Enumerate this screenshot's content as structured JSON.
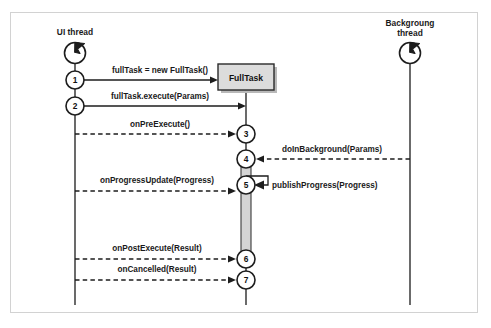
{
  "diagram": {
    "type": "uml-sequence-diagram",
    "frame": {
      "border_color": "#d2d2d2",
      "background": "#ffffff"
    },
    "lifelines": [
      {
        "id": "ui",
        "label_line1": "UI thread",
        "label_line2": "",
        "icon": "thread-icon",
        "x": 75
      },
      {
        "id": "bg",
        "label_line1": "Backgroung",
        "label_line2": "thread",
        "icon": "thread-icon",
        "x": 410
      }
    ],
    "object_box": {
      "label": "FullTask",
      "fill": "#dcdcdc",
      "border": "#2a2a2a",
      "x": 218,
      "y": 64,
      "width": 56,
      "height": 26
    },
    "activation": {
      "fill": "#d4d4d4",
      "border": "#3a3a3a"
    },
    "steps": [
      {
        "number": "1",
        "label": "fullTask = new FullTask()",
        "style": "solid",
        "direction": "right"
      },
      {
        "number": "2",
        "label": "fullTask.execute(Params)",
        "style": "solid",
        "direction": "right"
      },
      {
        "number": "3",
        "label": "onPreExecute()",
        "style": "dashed",
        "direction": "right"
      },
      {
        "number": "4",
        "label": "doInBackground(Params)",
        "style": "dashed",
        "direction": "left"
      },
      {
        "number": "5",
        "label": "onProgressUpdate(Progress)",
        "style": "dashed",
        "direction": "right"
      },
      {
        "number": "5b",
        "label": "publishProgress(Progress)",
        "style": "solid",
        "direction": "self"
      },
      {
        "number": "6",
        "label": "onPostExecute(Result)",
        "style": "dashed",
        "direction": "right"
      },
      {
        "number": "7",
        "label": "onCancelled(Result)",
        "style": "dashed",
        "direction": "right"
      }
    ],
    "numbers": {
      "n1": "1",
      "n2": "2",
      "n3": "3",
      "n4": "4",
      "n5": "5",
      "n6": "6",
      "n7": "7"
    },
    "labels": {
      "ui_thread": "UI thread",
      "bg_thread_l1": "Backgroung",
      "bg_thread_l2": "thread",
      "full_task": "FullTask",
      "m1": "fullTask = new FullTask()",
      "m2": "fullTask.execute(Params)",
      "m3": "onPreExecute()",
      "m4": "doInBackground(Params)",
      "m5": "onProgressUpdate(Progress)",
      "m5b": "publishProgress(Progress)",
      "m6": "onPostExecute(Result)",
      "m7": "onCancelled(Result)"
    }
  }
}
